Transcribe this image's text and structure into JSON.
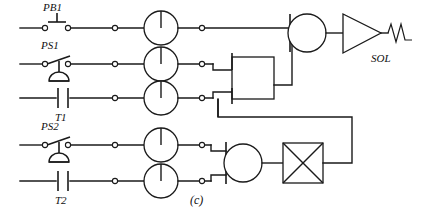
{
  "figure": {
    "caption": "(c)",
    "caption_x": 196,
    "caption_y": 202,
    "width": 425,
    "height": 217,
    "background_color": "#ffffff",
    "line_color": "#1a1a1a"
  },
  "labels": {
    "pb1": "PB1",
    "ps1": "PS1",
    "t1": "T1",
    "ps2": "PS2",
    "t2": "T2",
    "sol": "SOL"
  },
  "rows": [
    {
      "id": "row-1",
      "y": 28,
      "input_device": "push-button-normally-open",
      "input_label": "PB1",
      "has_valve_circle": true
    },
    {
      "id": "row-2",
      "y": 64,
      "input_device": "pressure-switch",
      "input_label": "PS1",
      "has_valve_circle": true
    },
    {
      "id": "row-3",
      "y": 98,
      "input_device": "timer-contact",
      "input_label": "T1",
      "has_valve_circle": true
    },
    {
      "id": "row-4",
      "y": 145,
      "input_device": "pressure-switch",
      "input_label": "PS2",
      "has_valve_circle": true
    },
    {
      "id": "row-5",
      "y": 181,
      "input_device": "timer-contact",
      "input_label": "T2",
      "has_valve_circle": true
    }
  ],
  "components": {
    "restrictor_circles": [
      {
        "name": "restrictor-row-1",
        "cx": 161,
        "cy": 28,
        "r": 17
      },
      {
        "name": "restrictor-row-2",
        "cx": 161,
        "cy": 64,
        "r": 17
      },
      {
        "name": "restrictor-row-3",
        "cx": 161,
        "cy": 98,
        "r": 17
      },
      {
        "name": "restrictor-row-4",
        "cx": 161,
        "cy": 145,
        "r": 17
      },
      {
        "name": "restrictor-row-5",
        "cx": 161,
        "cy": 181,
        "r": 17
      }
    ],
    "logic_box_upper": {
      "name": "or-logic-box-upper",
      "x": 232,
      "y": 57,
      "w": 42,
      "h": 42
    },
    "memory_circle_upper": {
      "name": "memory-element-upper",
      "cx": 307,
      "cy": 33,
      "r": 19
    },
    "amplifier": {
      "name": "amplifier-triangle",
      "x": 342,
      "y": 16,
      "w": 40,
      "h": 36
    },
    "solenoid_coil": {
      "name": "solenoid-coil",
      "x": 386,
      "y": 34
    },
    "memory_circle_lower": {
      "name": "memory-element-lower",
      "cx": 243,
      "cy": 163,
      "r": 19
    },
    "crossed_box": {
      "name": "crossed-valve-box",
      "x": 283,
      "y": 143,
      "w": 40,
      "h": 40
    }
  },
  "terminals": {
    "row_1": [
      45,
      68,
      115,
      202
    ],
    "row_2": [
      45,
      68,
      115,
      202
    ],
    "row_3": [
      115,
      202
    ],
    "row_4": [
      45,
      68,
      115,
      202
    ],
    "row_5": [
      115,
      202
    ]
  },
  "wire_segments": {
    "feedback_label": "feedback-line-from-crossed-box-to-upper-logic",
    "rail_left_x": 20,
    "rail_right_x": 412
  }
}
